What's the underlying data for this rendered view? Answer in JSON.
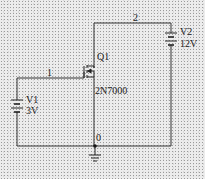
{
  "schematic": {
    "nodes": [
      {
        "id": "node-1",
        "label": "1"
      },
      {
        "id": "node-2",
        "label": "2"
      },
      {
        "id": "node-0",
        "label": "0"
      }
    ],
    "components": {
      "q1": {
        "ref": "Q1",
        "model": "2N7000"
      },
      "v1": {
        "ref": "V1",
        "value": "3V"
      },
      "v2": {
        "ref": "V2",
        "value": "12V"
      }
    },
    "colors": {
      "wire": "#333333",
      "background": "#ececec"
    }
  }
}
